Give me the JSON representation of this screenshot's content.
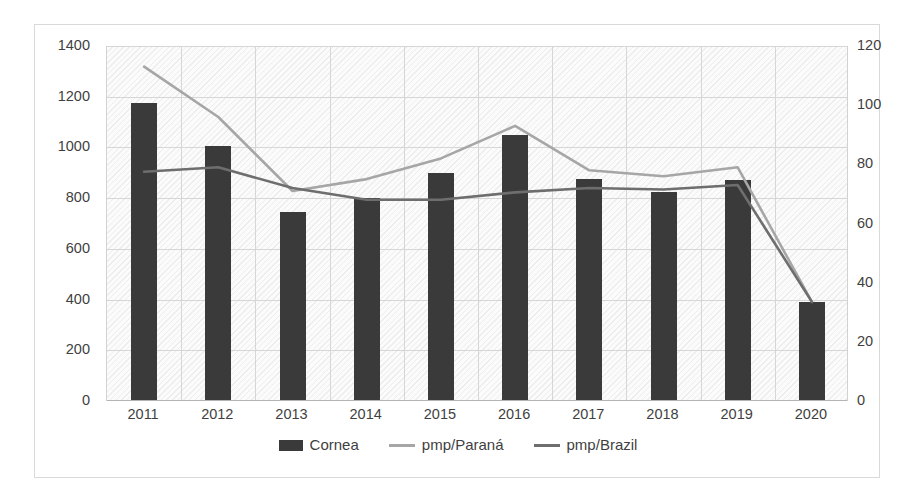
{
  "chart_data": {
    "type": "bar",
    "title": "",
    "subtitle": "",
    "xlabel": "",
    "ylabel": "",
    "categories": [
      "2011",
      "2012",
      "2013",
      "2014",
      "2015",
      "2016",
      "2017",
      "2018",
      "2019",
      "2020"
    ],
    "grid": true,
    "legend_position": "bottom",
    "axes": {
      "left": {
        "label": "",
        "min": 0,
        "max": 1400,
        "step": 200,
        "ticks": [
          "0",
          "200",
          "400",
          "600",
          "800",
          "1000",
          "1200",
          "1400"
        ]
      },
      "right": {
        "label": "",
        "min": 0,
        "max": 120,
        "step": 20,
        "ticks": [
          "0",
          "20",
          "40",
          "60",
          "80",
          "100",
          "120"
        ]
      }
    },
    "series": [
      {
        "name": "Cornea",
        "kind": "bar",
        "axis": "left",
        "color": "#3a3a3a",
        "values": [
          1175,
          1005,
          745,
          800,
          900,
          1050,
          875,
          825,
          870,
          390
        ]
      },
      {
        "name": "pmp/Paraná",
        "kind": "line",
        "axis": "right",
        "color": "#a6a6a6",
        "values": [
          113,
          96,
          71,
          75,
          82,
          93,
          78,
          76,
          79,
          33.5
        ]
      },
      {
        "name": "pmp/Brazil",
        "kind": "line",
        "axis": "right",
        "color": "#6e6e6e",
        "values": [
          77.5,
          79,
          72,
          68,
          68,
          70.5,
          72,
          71.5,
          73,
          33.5
        ]
      }
    ]
  },
  "colors": {
    "bar": "#3a3a3a",
    "line_parana": "#a6a6a6",
    "line_brazil": "#6e6e6e",
    "gridline": "#d6d6d6",
    "plot_background": "#fbfbfb",
    "card_border": "#d9d9d9",
    "tick_text": "#3f3f3f"
  }
}
